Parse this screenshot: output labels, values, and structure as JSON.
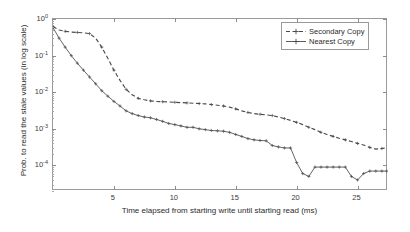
{
  "chart_data": {
    "type": "line",
    "title": "",
    "xlabel": "Time elapsed from starting write until starting read (ms)",
    "ylabel": "Prob. to read the stale values (in log scale)",
    "xlim": [
      0,
      27.5
    ],
    "ylim": [
      2e-05,
      1.0
    ],
    "yscale": "log",
    "grid": false,
    "legend_position": "top-right",
    "xticks": [
      5,
      10,
      15,
      20,
      25
    ],
    "xtick_labels": [
      "5",
      "10",
      "15",
      "20",
      "25"
    ],
    "yticks": [
      1,
      0.1,
      0.01,
      0.001,
      0.0001
    ],
    "ytick_labels": [
      "10",
      "10",
      "10",
      "10",
      "10"
    ],
    "ytick_exponents": [
      "0",
      "-1",
      "-2",
      "-3",
      "-4"
    ],
    "series": [
      {
        "name": "Secondary Copy",
        "style": "dashed",
        "color": "#4a4a4a",
        "marker": "plus",
        "x": [
          0,
          0.5,
          1,
          1.5,
          2,
          2.5,
          3,
          3.5,
          4,
          4.5,
          5,
          5.5,
          6,
          6.5,
          7,
          7.5,
          8,
          8.5,
          9,
          9.5,
          10,
          10.5,
          11,
          11.5,
          12,
          12.5,
          13,
          13.5,
          14,
          14.5,
          15,
          15.5,
          16,
          16.5,
          17,
          17.5,
          18,
          18.5,
          19,
          19.5,
          20,
          20.5,
          21,
          21.5,
          22,
          22.5,
          23,
          23.5,
          24,
          24.5,
          25,
          25.5,
          26,
          26.5,
          27,
          27.4
        ],
        "y": [
          0.62,
          0.5,
          0.46,
          0.44,
          0.43,
          0.42,
          0.4,
          0.3,
          0.17,
          0.085,
          0.04,
          0.021,
          0.012,
          0.0085,
          0.0068,
          0.0062,
          0.0058,
          0.0056,
          0.0055,
          0.0054,
          0.0053,
          0.0052,
          0.0051,
          0.005,
          0.0049,
          0.0048,
          0.0046,
          0.0044,
          0.0042,
          0.0039,
          0.0035,
          0.0031,
          0.0028,
          0.0026,
          0.0025,
          0.0024,
          0.0023,
          0.0021,
          0.0019,
          0.0017,
          0.0015,
          0.0013,
          0.0011,
          0.00095,
          0.0008,
          0.0007,
          0.00062,
          0.00055,
          0.0005,
          0.00045,
          0.0004,
          0.00036,
          0.00031,
          0.00028,
          0.00029,
          0.0003
        ]
      },
      {
        "name": "Nearest Copy",
        "style": "solid",
        "color": "#4a4a4a",
        "marker": "plus",
        "x": [
          0,
          0.5,
          1,
          1.5,
          2,
          2.5,
          3,
          3.5,
          4,
          4.5,
          5,
          5.5,
          6,
          6.5,
          7,
          7.5,
          8,
          8.5,
          9,
          9.5,
          10,
          10.5,
          11,
          11.5,
          12,
          12.5,
          13,
          13.5,
          14,
          14.5,
          15,
          15.5,
          16,
          16.5,
          17,
          17.5,
          18,
          18.5,
          19,
          19.5,
          20,
          20.5,
          21,
          21.5,
          22,
          22.5,
          23,
          23.5,
          24,
          24.5,
          25,
          25.5,
          26,
          26.5,
          27,
          27.4
        ],
        "y": [
          0.58,
          0.3,
          0.17,
          0.1,
          0.062,
          0.04,
          0.026,
          0.017,
          0.011,
          0.0078,
          0.0056,
          0.0042,
          0.0031,
          0.0026,
          0.0023,
          0.0021,
          0.002,
          0.0018,
          0.0016,
          0.0014,
          0.0013,
          0.0012,
          0.0011,
          0.0011,
          0.001,
          0.00095,
          0.0009,
          0.00088,
          0.00086,
          0.0008,
          0.0007,
          0.00062,
          0.00054,
          0.0005,
          0.00048,
          0.00047,
          0.00035,
          0.00032,
          0.0003,
          0.0003,
          0.00012,
          6e-05,
          5e-05,
          9e-05,
          9e-05,
          9e-05,
          9e-05,
          9e-05,
          9e-05,
          5e-05,
          4e-05,
          6e-05,
          7e-05,
          7e-05,
          7e-05,
          7e-05
        ]
      }
    ]
  },
  "legend": {
    "items": [
      {
        "label": "Secondary Copy"
      },
      {
        "label": "Nearest Copy"
      }
    ]
  }
}
